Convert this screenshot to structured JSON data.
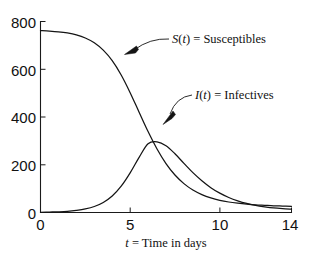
{
  "chart_data": {
    "type": "line",
    "title": "",
    "subtitle": "",
    "xlabel": "t = Time in days",
    "xlabel_parts": {
      "variable": "t",
      "rest": " = Time in days"
    },
    "ylabel": "",
    "xlim": [
      0,
      14
    ],
    "ylim": [
      0,
      800
    ],
    "xticks": [
      0,
      5,
      10,
      14
    ],
    "xtick_labels": [
      "0",
      "5",
      "10",
      "14"
    ],
    "yticks": [
      0,
      200,
      400,
      600,
      800
    ],
    "ytick_labels": [
      "0",
      "200",
      "400",
      "600",
      "800"
    ],
    "grid": false,
    "legend_position": "inline-annotations",
    "x": [
      0,
      0.5,
      1,
      1.5,
      2,
      2.5,
      3,
      3.5,
      4,
      4.5,
      5,
      5.5,
      6,
      6.5,
      7,
      7.5,
      8,
      8.5,
      9,
      9.5,
      10,
      10.5,
      11,
      11.5,
      12,
      12.5,
      13,
      13.5,
      14
    ],
    "series": [
      {
        "name": "S(t) = Susceptibles",
        "name_parts": {
          "variable": "S",
          "paren_open": "(",
          "arg": "t",
          "paren_close": ")",
          "rest": " = Susceptibles"
        },
        "values": [
          762,
          760,
          757,
          752,
          744,
          731,
          711,
          680,
          636,
          576,
          502,
          420,
          339,
          266,
          205,
          157,
          121,
          94,
          75,
          61,
          51,
          44,
          39,
          35,
          32,
          30,
          28,
          27,
          26
        ]
      },
      {
        "name": "I(t) = Infectives",
        "name_parts": {
          "variable": "I",
          "paren_open": "(",
          "arg": "t",
          "paren_close": ")",
          "rest": " = Infectives"
        },
        "values": [
          1,
          2,
          3,
          5,
          9,
          15,
          25,
          42,
          69,
          110,
          166,
          231,
          288,
          296,
          280,
          246,
          206,
          167,
          133,
          104,
          81,
          63,
          49,
          38,
          30,
          24,
          19,
          16,
          14
        ]
      }
    ],
    "annotations": [
      {
        "id": "susceptibles-annotation",
        "text": "S(t) = Susceptibles",
        "points_to_series": "S(t) = Susceptibles",
        "target_x": 4.2,
        "target_y": 648
      },
      {
        "id": "infectives-annotation",
        "text": "I(t) = Infectives",
        "points_to_series": "I(t) = Infectives",
        "target_x": 6.9,
        "target_y": 318
      }
    ],
    "peak": {
      "series": "I(t) = Infectives",
      "x": 6.5,
      "y": 296
    },
    "crossing_point": {
      "x": 6.0,
      "y": 300
    },
    "colors": {
      "curve": "#141414",
      "axis": "#1a1a1a",
      "background": "#ffffff"
    }
  }
}
